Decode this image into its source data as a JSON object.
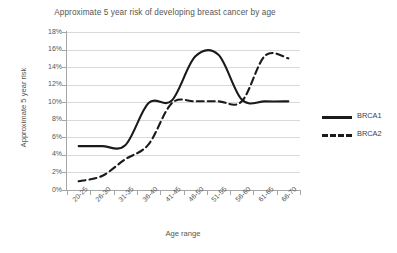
{
  "chart_data": {
    "type": "line",
    "title": "Approximate 5 year risk of developing breast cancer by age",
    "xlabel": "Age range",
    "ylabel": "Approximate 5 year risk",
    "categories": [
      "20-25",
      "26-30",
      "31-35",
      "36-40",
      "41-45",
      "46-50",
      "51-55",
      "56-60",
      "61-65",
      "66-70"
    ],
    "ylim": [
      0,
      18
    ],
    "ytick_labels": [
      "0%",
      "2%",
      "4%",
      "6%",
      "8%",
      "10%",
      "12%",
      "14%",
      "16%",
      "18%"
    ],
    "ytick_values": [
      0,
      2,
      4,
      6,
      8,
      10,
      12,
      14,
      16,
      18
    ],
    "grid": true,
    "legend_position": "right",
    "series": [
      {
        "name": "BRCA1",
        "style": "solid",
        "color": "#1a1a1a",
        "values": [
          5.0,
          5.0,
          5.1,
          9.9,
          10.2,
          15.2,
          15.4,
          10.3,
          10.1,
          10.1
        ]
      },
      {
        "name": "BRCA2",
        "style": "dashed",
        "color": "#1a1a1a",
        "values": [
          1.0,
          1.6,
          3.5,
          5.2,
          9.9,
          10.1,
          10.1,
          10.1,
          15.3,
          15.0
        ]
      }
    ]
  }
}
